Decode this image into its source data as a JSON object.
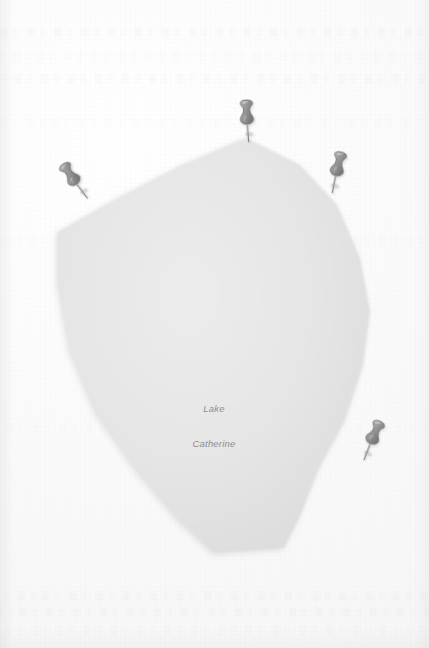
{
  "map": {
    "background_color": "#fafafa",
    "paper_texture": "scanned-paper",
    "feature": {
      "name_line_1": "Lake",
      "name_line_2": "Catherine",
      "full_name": "Lake Catherine",
      "type": "lake-polygon",
      "fill_color": "#e3e3e3",
      "edge_shadow_color": "#cfcfcf",
      "label_color": "#8e8f92",
      "label_x": 214,
      "label_y": 386,
      "outline_points": "246,138 300,165 337,205 360,258 370,311 363,365 345,420 318,470 300,516 284,548 214,553 178,519 135,468 96,412 70,350 58,282 58,232 118,198 180,166"
    },
    "pins": [
      {
        "id": "pin-north",
        "label": "map-pin-north",
        "x": 233,
        "y": 98,
        "rotation": -2,
        "color": "#9a9a9d"
      },
      {
        "id": "pin-northwest",
        "label": "map-pin-northwest",
        "x": 71,
        "y": 155,
        "rotation": -34,
        "color": "#9a9a9d"
      },
      {
        "id": "pin-northeast",
        "label": "map-pin-northeast",
        "x": 317,
        "y": 149,
        "rotation": 14,
        "color": "#9a9a9d"
      },
      {
        "id": "pin-southeast",
        "label": "map-pin-southeast",
        "x": 349,
        "y": 416,
        "rotation": 24,
        "color": "#9a9a9d"
      }
    ],
    "ghost_text_bands": [
      {
        "top": 28,
        "opacity": 0.3
      },
      {
        "top": 52,
        "opacity": 0.22
      },
      {
        "top": 74,
        "opacity": 0.34
      },
      {
        "top": 118,
        "opacity": 0.18
      },
      {
        "top": 236,
        "opacity": 0.14
      },
      {
        "top": 424,
        "opacity": 0.16
      },
      {
        "top": 592,
        "opacity": 0.3
      },
      {
        "top": 608,
        "opacity": 0.34
      },
      {
        "top": 626,
        "opacity": 0.2
      }
    ]
  }
}
